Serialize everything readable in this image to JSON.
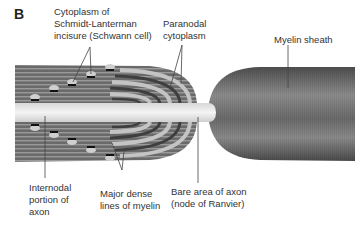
{
  "figure": {
    "panel_letter": "B",
    "labels": {
      "schmidt_lanterman": "Cytoplasm of\nSchmidt-Lanterman\nincisure (Schwann cell)",
      "paranodal": "Paranodal\ncytoplasm",
      "myelin_sheath": "Myelin sheath",
      "internodal_axon": "Internodal\nportion of\naxon",
      "major_dense_lines": "Major dense\nlines of myelin",
      "node_of_ranvier": "Bare area of axon\n(node of Ranvier)"
    },
    "colors": {
      "myelin_dark": "#5a5a5a",
      "myelin_mid": "#8a8a8a",
      "axon": "#e8e8e8",
      "paranodal_light": "#c4c4c4",
      "leader_line": "#444444"
    }
  }
}
